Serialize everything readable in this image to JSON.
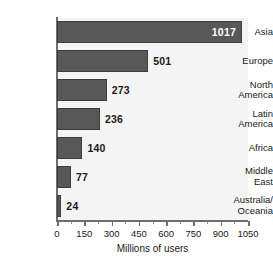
{
  "chart_data": {
    "type": "bar",
    "orientation": "horizontal",
    "title": "",
    "xlabel": "Millions of users",
    "ylabel": "",
    "xlim": [
      0,
      1050
    ],
    "ylim": null,
    "grid": false,
    "legend": null,
    "categories": [
      "Asia",
      "Europe",
      "North\nAmerica",
      "Latin\nAmerica",
      "Africa",
      "Middle\nEast",
      "Australia/\nOceania"
    ],
    "values": [
      1017,
      501,
      273,
      236,
      140,
      77,
      24
    ],
    "value_labels": [
      "1017",
      "501",
      "273",
      "236",
      "140",
      "77",
      "24"
    ],
    "xticks": [
      0,
      150,
      300,
      450,
      600,
      750,
      900,
      1050
    ],
    "xtick_labels": [
      "0",
      "150",
      "300",
      "450",
      "600",
      "750",
      "900",
      "1050"
    ],
    "xticks_minor": [
      75,
      225,
      375,
      525,
      675,
      825,
      975
    ],
    "colors": {
      "bar_fill": "#585858",
      "bar_stroke": "#3d3d3d",
      "plot_background": "#f4f4f4",
      "page_background": "#ffffff",
      "axis": "#6e6e6e",
      "text": "#1a1a1a",
      "inside_label_text": "#ffffff"
    }
  }
}
